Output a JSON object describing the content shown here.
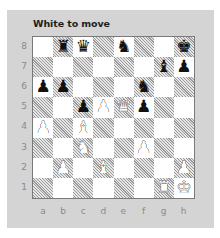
{
  "puzzle": {
    "title": "White to move",
    "side_to_move": "white"
  },
  "board": {
    "ranks": [
      "8",
      "7",
      "6",
      "5",
      "4",
      "3",
      "2",
      "1"
    ],
    "files": [
      "a",
      "b",
      "c",
      "d",
      "e",
      "f",
      "g",
      "h"
    ],
    "squares": [
      [
        "",
        "♜",
        "♛",
        "",
        "♞",
        "",
        "",
        "♚"
      ],
      [
        "",
        "",
        "",
        "",
        "",
        "",
        "♝",
        "♟"
      ],
      [
        "♟",
        "♟",
        "",
        "",
        "",
        "♞",
        "",
        ""
      ],
      [
        "",
        "",
        "♟",
        "♙",
        "♕",
        "♟",
        "",
        ""
      ],
      [
        "♙",
        "",
        "♗",
        "",
        "",
        "",
        "",
        ""
      ],
      [
        "",
        "",
        "♘",
        "",
        "",
        "♙",
        "",
        ""
      ],
      [
        "",
        "♙",
        "",
        "♗",
        "",
        "",
        "",
        "♙"
      ],
      [
        "",
        "",
        "",
        "",
        "",
        "",
        "♖",
        "♔"
      ]
    ],
    "pieces": [
      {
        "square": "b8",
        "color": "black",
        "type": "rook"
      },
      {
        "square": "c8",
        "color": "black",
        "type": "queen"
      },
      {
        "square": "e8",
        "color": "black",
        "type": "knight"
      },
      {
        "square": "h8",
        "color": "black",
        "type": "king"
      },
      {
        "square": "g7",
        "color": "black",
        "type": "bishop"
      },
      {
        "square": "h7",
        "color": "black",
        "type": "pawn"
      },
      {
        "square": "a6",
        "color": "black",
        "type": "pawn"
      },
      {
        "square": "b6",
        "color": "black",
        "type": "pawn"
      },
      {
        "square": "f6",
        "color": "black",
        "type": "knight"
      },
      {
        "square": "c5",
        "color": "black",
        "type": "pawn"
      },
      {
        "square": "d5",
        "color": "white",
        "type": "pawn"
      },
      {
        "square": "e5",
        "color": "white",
        "type": "queen"
      },
      {
        "square": "f5",
        "color": "black",
        "type": "pawn"
      },
      {
        "square": "a4",
        "color": "white",
        "type": "pawn"
      },
      {
        "square": "c4",
        "color": "white",
        "type": "bishop"
      },
      {
        "square": "c3",
        "color": "white",
        "type": "knight"
      },
      {
        "square": "f3",
        "color": "white",
        "type": "pawn"
      },
      {
        "square": "b2",
        "color": "white",
        "type": "pawn"
      },
      {
        "square": "d2",
        "color": "white",
        "type": "bishop"
      },
      {
        "square": "h2",
        "color": "white",
        "type": "pawn"
      },
      {
        "square": "g1",
        "color": "white",
        "type": "rook"
      },
      {
        "square": "h1",
        "color": "white",
        "type": "king"
      }
    ]
  },
  "colors": {
    "panel": "#d4d4d4",
    "light_square": "#ffffff",
    "dark_square_hatch": "#9a9a9a",
    "coordinate_text": "#8a8a8a"
  }
}
